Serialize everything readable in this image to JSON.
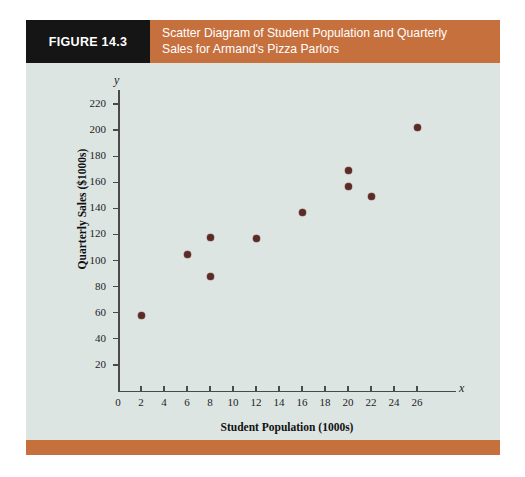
{
  "figure": {
    "tag": "FIGURE 14.3",
    "title_line1": "Scatter Diagram of Student Population and Quarterly",
    "title_line2": "Sales for Armand's Pizza Parlors",
    "tag_bg": "#151515",
    "title_bg": "#c6703d",
    "panel_bg": "#dde5e3",
    "point_color": "#5d2b26"
  },
  "chart_data": {
    "type": "scatter",
    "title": "Scatter Diagram of Student Population and Quarterly Sales for Armand's Pizza Parlors",
    "xlabel": "Student Population (1000s)",
    "ylabel": "Quarterly Sales ($1000s)",
    "x_axis_letter": "x",
    "y_axis_letter": "y",
    "xlim": [
      0,
      28
    ],
    "ylim": [
      0,
      230
    ],
    "xticks": [
      0,
      2,
      4,
      6,
      8,
      10,
      12,
      14,
      16,
      18,
      20,
      22,
      24,
      26
    ],
    "yticks": [
      20,
      40,
      60,
      80,
      100,
      120,
      140,
      160,
      180,
      200,
      220
    ],
    "grid": false,
    "legend": null,
    "points": [
      {
        "x": 2,
        "y": 58
      },
      {
        "x": 6,
        "y": 105
      },
      {
        "x": 8,
        "y": 88
      },
      {
        "x": 8,
        "y": 118
      },
      {
        "x": 12,
        "y": 117
      },
      {
        "x": 16,
        "y": 137
      },
      {
        "x": 20,
        "y": 157
      },
      {
        "x": 20,
        "y": 169
      },
      {
        "x": 22,
        "y": 149
      },
      {
        "x": 26,
        "y": 202
      }
    ]
  }
}
